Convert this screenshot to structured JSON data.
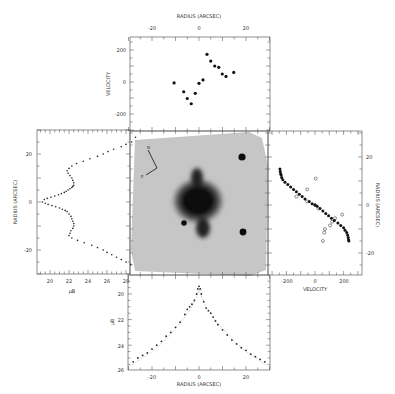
{
  "figure": {
    "image_panel": {
      "compass": {
        "north_label": "N",
        "east_label": "E"
      }
    }
  },
  "chart_data": [
    {
      "id": "top",
      "type": "scatter",
      "title": "",
      "xlabel": "RADIUS (ARCSEC)",
      "ylabel": "VELOCITY",
      "xlim": [
        -30,
        30
      ],
      "ylim": [
        -300,
        300
      ],
      "xticks": [
        -20,
        0,
        20
      ],
      "yticks": [
        200,
        0,
        -200
      ],
      "series": [
        {
          "name": "velocity",
          "marker": "filled-circle",
          "x": [
            -10.6,
            -6.5,
            -5.0,
            -3.3,
            -1.6,
            0.0,
            1.7,
            3.4,
            5.0,
            6.7,
            8.4,
            9.9,
            11.5,
            14.8
          ],
          "y": [
            -6,
            -61,
            -103,
            -136,
            -71,
            -8,
            13,
            173,
            131,
            100,
            92,
            50,
            35,
            60
          ]
        }
      ]
    },
    {
      "id": "left",
      "type": "scatter",
      "xlabel": "μB",
      "ylabel": "RADIUS (ARCSEC)",
      "xlim": [
        18.5,
        29.5
      ],
      "ylim": [
        -30,
        30
      ],
      "xticks": [
        20,
        22,
        24,
        26,
        28
      ],
      "yticks": [
        20,
        0,
        -20
      ],
      "series": [
        {
          "name": "surface brightness",
          "marker": "dot",
          "x": [
            19.2,
            19.4,
            19.7,
            20.1,
            20.5,
            20.9,
            21.2,
            21.5,
            21.7,
            21.9,
            22.1,
            22.3,
            22.4,
            22.5,
            22.5,
            22.4,
            22.3,
            22.1,
            21.9,
            21.8,
            22.0,
            22.3,
            22.8,
            23.5,
            24.2,
            25.0,
            25.6,
            26.1,
            26.7,
            27.5,
            28.0,
            28.6,
            29.0,
            19.5,
            19.8,
            20.2,
            20.6,
            21.0,
            21.3,
            21.6,
            21.8,
            22.0,
            22.2,
            22.3,
            22.4,
            22.5,
            22.5,
            22.4,
            22.2,
            22.1,
            22.0,
            22.3,
            22.9,
            23.6,
            24.4,
            25.0,
            25.6,
            26.0,
            26.5,
            27.0,
            27.5,
            28.0,
            28.5
          ],
          "y": [
            0,
            1,
            1.5,
            2,
            2.5,
            3,
            3.5,
            4,
            4.5,
            5,
            5.5,
            6,
            6.5,
            7,
            8,
            9,
            10,
            11,
            12,
            13,
            14,
            15,
            16,
            17,
            18,
            19,
            20,
            21,
            22,
            23,
            24,
            25,
            27,
            -0.5,
            -1,
            -1.5,
            -2,
            -2.5,
            -3,
            -3.5,
            -4,
            -5,
            -6,
            -7,
            -8,
            -9,
            -10,
            -11,
            -12,
            -13,
            -14,
            -15,
            -16,
            -17,
            -18,
            -19,
            -20,
            -21,
            -22,
            -23,
            -24,
            -25,
            -26,
            -27,
            -28
          ]
        }
      ]
    },
    {
      "id": "right",
      "type": "scatter",
      "xlabel": "VELOCITY",
      "ylabel": "RADIUS (ARCSEC)",
      "xlim": [
        -270,
        270
      ],
      "ylim": [
        -30,
        30
      ],
      "xticks": [
        -200,
        0,
        200
      ],
      "yticks": [
        20,
        0,
        -20
      ],
      "series": [
        {
          "name": "filled",
          "marker": "filled-circle",
          "x": [
            -245,
            -243,
            -240,
            -237,
            -233,
            -225,
            -210,
            -190,
            -170,
            -150,
            -130,
            -110,
            -90,
            -70,
            -40,
            -20,
            0,
            15,
            35,
            55,
            75,
            95,
            115,
            135,
            160,
            180,
            200,
            210,
            222,
            228,
            232,
            235,
            237
          ],
          "y": [
            15,
            14,
            13,
            12.5,
            11.5,
            10.5,
            9.5,
            8.5,
            7.5,
            6.5,
            5.5,
            4.5,
            3.5,
            2.5,
            1.5,
            0.5,
            0,
            -0.5,
            -1.5,
            -2.5,
            -3.5,
            -4.5,
            -5.5,
            -6.5,
            -7.5,
            -8.5,
            -9.5,
            -10.5,
            -11.5,
            -12.5,
            -13.5,
            -14.5,
            -15
          ]
        },
        {
          "name": "open",
          "marker": "open-circle",
          "x": [
            5,
            -55,
            -130,
            -55,
            0,
            25,
            190,
            140,
            120,
            105,
            70,
            65,
            55
          ],
          "y": [
            11,
            6.5,
            3.5,
            1.5,
            0,
            -1.5,
            -4,
            -5.5,
            -7,
            -8.5,
            -10,
            -11.5,
            -15
          ]
        }
      ]
    },
    {
      "id": "bottom",
      "type": "scatter",
      "xlabel": "RADIUS (ARCSEC)",
      "ylabel": "μB",
      "xlim": [
        -30,
        30
      ],
      "ylim": [
        26,
        18.5
      ],
      "xticks": [
        -20,
        0,
        20
      ],
      "yticks": [
        20,
        22,
        24,
        26
      ],
      "series": [
        {
          "name": "profile",
          "marker": "dot",
          "x": [
            -28,
            -26,
            -24,
            -22,
            -20,
            -18,
            -16,
            -14,
            -12,
            -10,
            -8,
            -6,
            -5,
            -4,
            -3,
            -2,
            -1,
            -0.5,
            0,
            0.5,
            1,
            2,
            3,
            4,
            5,
            6,
            7,
            8,
            10,
            12,
            14,
            16,
            18,
            20,
            22,
            24,
            26,
            28
          ],
          "y": [
            25.3,
            25.0,
            24.8,
            24.6,
            24.3,
            24.0,
            23.7,
            23.3,
            23.0,
            22.6,
            22.2,
            21.6,
            21.2,
            21.0,
            20.8,
            20.5,
            20.0,
            19.6,
            19.4,
            19.6,
            20.0,
            20.6,
            21.1,
            21.3,
            21.5,
            21.8,
            22.1,
            22.4,
            22.8,
            23.2,
            23.6,
            23.9,
            24.2,
            24.4,
            24.7,
            24.9,
            25.1,
            25.3
          ]
        },
        {
          "name": "model",
          "marker": "fine-dot",
          "x": [
            -29,
            -25,
            -20,
            -15,
            -10,
            -6,
            -3,
            -1,
            0,
            1,
            3,
            6,
            10,
            15,
            20,
            25,
            29
          ],
          "y": [
            25.6,
            25.1,
            24.5,
            23.7,
            22.7,
            21.8,
            21.0,
            20.2,
            19.7,
            20.2,
            21.0,
            21.8,
            22.7,
            23.7,
            24.5,
            25.1,
            25.6
          ]
        }
      ]
    }
  ]
}
